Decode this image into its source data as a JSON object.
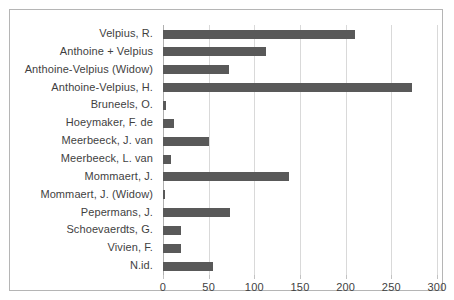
{
  "chart_data": {
    "type": "bar",
    "orientation": "horizontal",
    "title": "",
    "subtitle": "",
    "xlabel": "",
    "ylabel": "",
    "xlim": [
      0,
      300
    ],
    "xticks": [
      0,
      50,
      100,
      150,
      200,
      250,
      300
    ],
    "xtick_labels": [
      "0",
      "50",
      "100",
      "150",
      "200",
      "250",
      "300"
    ],
    "grid": true,
    "grid_axis": "x",
    "legend": false,
    "legend_position": "none",
    "bar_color": "#595959",
    "grid_color": "#d9d9d9",
    "axis_color": "#b0b0b0",
    "text_color": "#3f3f3f",
    "frame_color": "#b5b5b5",
    "categories": [
      "Velpius, R.",
      "Anthoine + Velpius",
      "Anthoine-Velpius (Widow)",
      "Anthoine-Velpius, H.",
      "Bruneels, O.",
      "Hoeymaker, F. de",
      "Meerbeeck, J. van",
      "Meerbeeck, L. van",
      "Mommaert, J.",
      "Mommaert, J. (Widow)",
      "Pepermans, J.",
      "Schoevaerdts, G.",
      "Vivien, F.",
      "N.id."
    ],
    "values": [
      210,
      113,
      72,
      273,
      3,
      12,
      50,
      9,
      138,
      2,
      73,
      20,
      20,
      55
    ]
  }
}
